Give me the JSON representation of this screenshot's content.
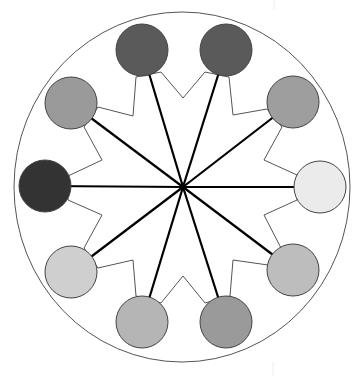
{
  "diagram": {
    "type": "radial-network",
    "outer_circle": {
      "cx": 182,
      "cy": 187,
      "rx": 168,
      "ry": 175,
      "stroke": "#555555"
    },
    "hub": {
      "x": 183,
      "y": 187
    },
    "node_radius": 26,
    "nodes": [
      {
        "id": "n1",
        "position": "top-left",
        "cx": 142,
        "cy": 50,
        "fill": "#5a5a5a"
      },
      {
        "id": "n2",
        "position": "top-right",
        "cx": 226,
        "cy": 50,
        "fill": "#5a5a5a"
      },
      {
        "id": "n3",
        "position": "upper-right",
        "cx": 293,
        "cy": 102,
        "fill": "#9e9e9e"
      },
      {
        "id": "n4",
        "position": "right",
        "cx": 320,
        "cy": 187,
        "fill": "#ebebeb"
      },
      {
        "id": "n5",
        "position": "lower-right",
        "cx": 293,
        "cy": 270,
        "fill": "#bdbdbd"
      },
      {
        "id": "n6",
        "position": "bottom-right",
        "cx": 226,
        "cy": 322,
        "fill": "#9a9a9a"
      },
      {
        "id": "n7",
        "position": "bottom-left",
        "cx": 142,
        "cy": 322,
        "fill": "#b5b5b5"
      },
      {
        "id": "n8",
        "position": "lower-left",
        "cx": 71,
        "cy": 272,
        "fill": "#cfcfcf"
      },
      {
        "id": "n9",
        "position": "left",
        "cx": 45,
        "cy": 186,
        "fill": "#333333"
      },
      {
        "id": "n10",
        "position": "upper-left",
        "cx": 71,
        "cy": 103,
        "fill": "#9a9a9a"
      }
    ],
    "zigzag_path": [
      [
        161,
        72
      ],
      [
        183,
        98
      ],
      [
        205,
        72
      ],
      [
        229,
        77
      ],
      [
        233,
        115
      ],
      [
        267,
        109
      ],
      [
        282,
        127
      ],
      [
        264,
        160
      ],
      [
        297,
        175
      ],
      [
        297,
        200
      ],
      [
        264,
        215
      ],
      [
        281,
        248
      ],
      [
        268,
        265
      ],
      [
        233,
        260
      ],
      [
        230,
        296
      ],
      [
        205,
        303
      ],
      [
        183,
        276
      ],
      [
        161,
        303
      ],
      [
        136,
        296
      ],
      [
        133,
        260
      ],
      [
        98,
        268
      ],
      [
        84,
        248
      ],
      [
        102,
        215
      ],
      [
        68,
        200
      ],
      [
        68,
        176
      ],
      [
        102,
        160
      ],
      [
        84,
        127
      ],
      [
        98,
        107
      ],
      [
        133,
        116
      ],
      [
        136,
        77
      ]
    ],
    "colors": {
      "spoke": "#000000",
      "zigzag": "#555555",
      "node_stroke": "#444444",
      "background": "#ffffff"
    }
  }
}
